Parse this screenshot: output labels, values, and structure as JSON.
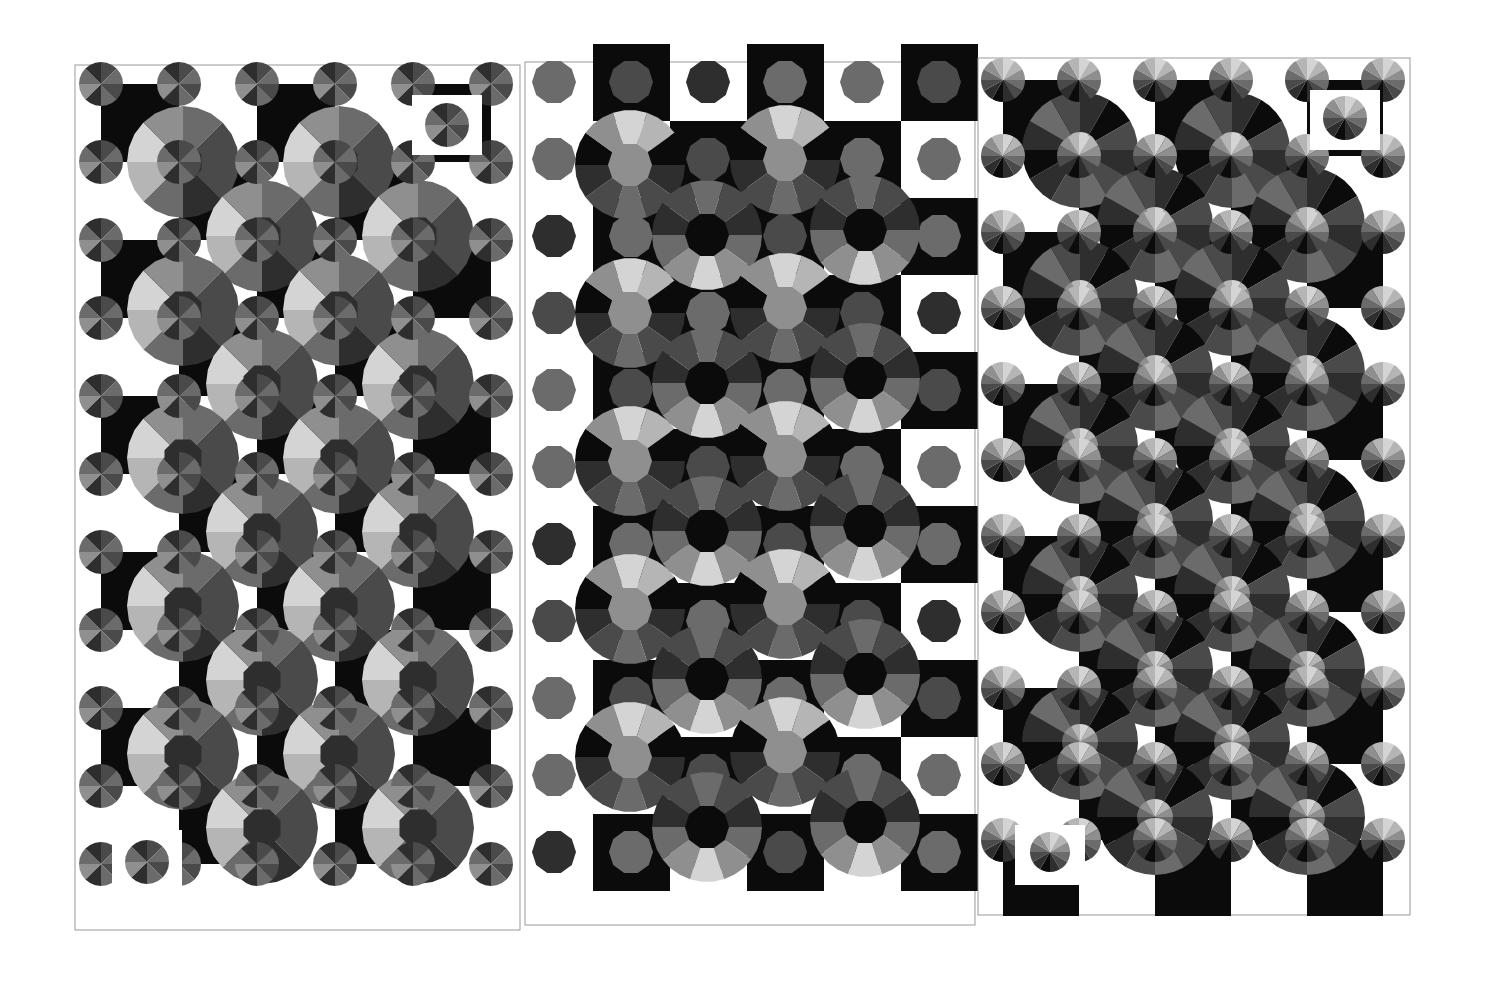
{
  "artwork": {
    "description": "Three-panel grayscale geometric print of tiled octagons, black bars and large segmented circles",
    "colors": {
      "background": "#ffffff",
      "black": "#0b0b0b",
      "dark": "#2e2e2e",
      "mid_dark": "#4a4a4a",
      "mid": "#6b6b6b",
      "mid_light": "#8f8f8f",
      "light": "#b5b5b5",
      "pale": "#d4d4d4"
    },
    "panels": [
      {
        "name": "left-panel",
        "x": 75,
        "y": 65,
        "width": 445,
        "height": 865,
        "pattern": "quadrant-shaded circles on black/white grid"
      },
      {
        "name": "middle-panel",
        "x": 525,
        "y": 62,
        "width": 450,
        "height": 863,
        "pattern": "ring-segment circles with octagon hubs"
      },
      {
        "name": "right-panel",
        "x": 978,
        "y": 58,
        "width": 432,
        "height": 857,
        "pattern": "radial-fan octagons with textured dark circles"
      }
    ]
  }
}
